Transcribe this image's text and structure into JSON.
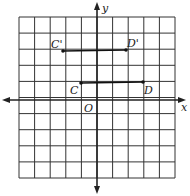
{
  "diagram": {
    "type": "coordinate-grid",
    "grid": {
      "x_min": -5,
      "x_max": 5,
      "y_min": -5,
      "y_max": 5
    },
    "axes": {
      "x_label": "x",
      "y_label": "y",
      "origin_label": "O"
    },
    "points": [
      {
        "name": "C",
        "x": -1,
        "y": 1
      },
      {
        "name": "D",
        "x": 3,
        "y": 1
      },
      {
        "name": "C'",
        "x": -2,
        "y": 3
      },
      {
        "name": "D'",
        "x": 2,
        "y": 3
      }
    ],
    "segments": [
      {
        "from": "C",
        "to": "D"
      },
      {
        "from": "C'",
        "to": "D'"
      }
    ],
    "colors": {
      "line": "#222222",
      "background": "#ffffff"
    }
  }
}
